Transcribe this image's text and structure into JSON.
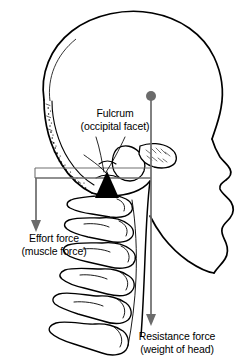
{
  "diagram": {
    "type": "anatomical-lever-diagram",
    "view": "lateral (side) view of skull and cervical vertebrae"
  },
  "labels": {
    "fulcrum": {
      "line1": "Fulcrum",
      "line2": "(occipital facet)",
      "marker": "black-triangle"
    },
    "effort": {
      "line1": "Effort force",
      "line2": "(muscle force)",
      "marker": "down-arrow"
    },
    "resistance": {
      "line1": "Resistance force",
      "line2": "(weight of head)",
      "marker": "down-arrow-with-dot"
    }
  },
  "colors": {
    "outline": "#000000",
    "arrow": "#6b6b6b",
    "lever_line": "#6b6b6b",
    "fulcrum_fill": "#000000",
    "background": "#ffffff"
  },
  "geometry": {
    "lever_line_y": 178,
    "lever_line_x_start": 35,
    "lever_line_x_end": 151,
    "fulcrum_apex_x": 107,
    "effort_arrow_x": 36,
    "effort_arrow_y_start": 178,
    "effort_arrow_y_end": 231,
    "resistance_arrow_x": 151,
    "resistance_arrow_y_start": 96,
    "resistance_arrow_y_end": 326,
    "resistance_dot_radius": 5
  }
}
